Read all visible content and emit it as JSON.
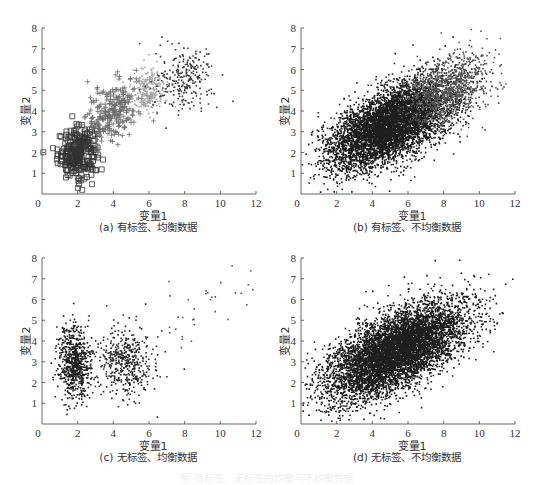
{
  "figure_caption": "图  有标签、无标签的均衡与不均衡数据",
  "chart_data": [
    {
      "id": "a",
      "type": "scatter",
      "title": "(a) 有标签、均衡数据",
      "xlabel": "变量1",
      "ylabel": "变量2",
      "xlim": [
        0,
        12
      ],
      "ylim": [
        0,
        8
      ],
      "xticks": [
        0,
        2,
        4,
        6,
        8,
        10,
        12
      ],
      "yticks": [
        1,
        2,
        3,
        4,
        5,
        6,
        7,
        8
      ],
      "grid": false,
      "legend": "none",
      "series": [
        {
          "name": "类别1",
          "marker": "square",
          "color": "#333333",
          "count": 260,
          "center": [
            2.0,
            2.0
          ],
          "std": [
            0.55,
            0.6
          ],
          "corr": 0.1
        },
        {
          "name": "类别2",
          "marker": "plus",
          "color": "#6a6a6a",
          "count": 260,
          "center": [
            4.0,
            4.0
          ],
          "std": [
            0.75,
            0.75
          ],
          "corr": 0.35
        },
        {
          "name": "类别3",
          "marker": "dot",
          "color": "#a8a8a8",
          "count": 260,
          "center": [
            6.0,
            5.0
          ],
          "std": [
            0.5,
            0.55
          ],
          "corr": 0.2
        },
        {
          "name": "类别4",
          "marker": "dot",
          "color": "#3a3a3a",
          "count": 260,
          "center": [
            8.0,
            5.5
          ],
          "std": [
            0.8,
            0.75
          ],
          "corr": 0.1
        }
      ]
    },
    {
      "id": "b",
      "type": "scatter",
      "title": "(b) 有标签、不均衡数据",
      "xlabel": "变量1",
      "ylabel": "变量2",
      "xlim": [
        0,
        12
      ],
      "ylim": [
        0,
        8
      ],
      "xticks": [
        0,
        2,
        4,
        6,
        8,
        10,
        12
      ],
      "yticks": [
        1,
        2,
        3,
        4,
        5,
        6,
        7,
        8
      ],
      "grid": false,
      "legend": "none",
      "series": [
        {
          "name": "多数类",
          "marker": "dot",
          "color": "#1e1e1e",
          "count": 6000,
          "center": [
            5.0,
            3.3
          ],
          "std": [
            1.7,
            1.05
          ],
          "corr": 0.6
        },
        {
          "name": "少数类",
          "marker": "dot",
          "color": "#555555",
          "count": 900,
          "center": [
            8.2,
            5.0
          ],
          "std": [
            1.2,
            0.9
          ],
          "corr": 0.4
        }
      ]
    },
    {
      "id": "c",
      "type": "scatter",
      "title": "(c) 无标签、均衡数据",
      "xlabel": "变量1",
      "ylabel": "变量2",
      "xlim": [
        0,
        12
      ],
      "ylim": [
        0,
        8
      ],
      "xticks": [
        0,
        2,
        4,
        6,
        8,
        10,
        12
      ],
      "yticks": [
        1,
        2,
        3,
        4,
        5,
        6,
        7,
        8
      ],
      "grid": false,
      "legend": "none",
      "series": [
        {
          "name": "簇1",
          "marker": "dot",
          "color": "#222222",
          "count": 700,
          "center": [
            1.8,
            2.9
          ],
          "std": [
            0.45,
            0.9
          ],
          "corr": 0.0
        },
        {
          "name": "簇2",
          "marker": "dot",
          "color": "#2a2a2a",
          "count": 450,
          "center": [
            4.7,
            3.0
          ],
          "std": [
            0.8,
            0.85
          ],
          "corr": 0.0
        },
        {
          "name": "簇3",
          "marker": "dot",
          "color": "#555555",
          "count": 35,
          "center": [
            9.0,
            5.5
          ],
          "std": [
            1.5,
            1.0
          ],
          "corr": 0.5
        }
      ]
    },
    {
      "id": "d",
      "type": "scatter",
      "title": "(d) 无标签、不均衡数据",
      "xlabel": "变量1",
      "ylabel": "变量2",
      "xlim": [
        0,
        12
      ],
      "ylim": [
        0,
        8
      ],
      "xticks": [
        0,
        2,
        4,
        6,
        8,
        10,
        12
      ],
      "yticks": [
        1,
        2,
        3,
        4,
        5,
        6,
        7,
        8
      ],
      "grid": false,
      "legend": "none",
      "series": [
        {
          "name": "全部样本",
          "marker": "dot",
          "color": "#1e1e1e",
          "count": 6900,
          "center": [
            5.3,
            3.5
          ],
          "std": [
            1.9,
            1.15
          ],
          "corr": 0.62
        }
      ]
    }
  ]
}
